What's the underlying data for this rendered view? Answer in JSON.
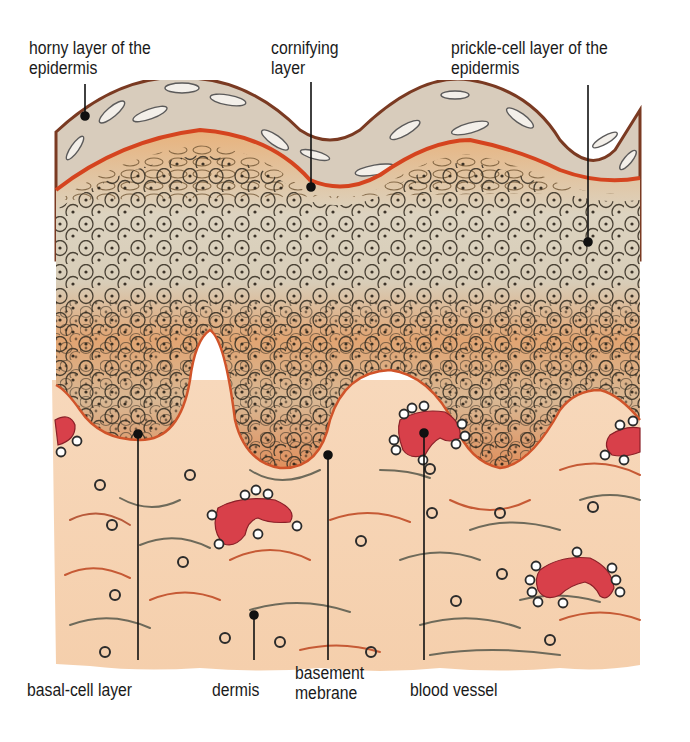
{
  "diagram": {
    "colors": {
      "background": "#ffffff",
      "horny_layer": "#d6cbbd",
      "horny_outline": "#7a3a22",
      "cornifying_line": "#d5441f",
      "prickle_light": "#d9d2c0",
      "prickle_orange": "#e3a676",
      "dermis": "#f6d2b0",
      "blood_vessel": "#d8404a",
      "cell_outline": "#2b2b2b",
      "leader_line": "#111111",
      "label_text": "#1a1a1a"
    },
    "labels": {
      "horny_layer": "horny layer of the\nepidermis",
      "cornifying_layer": "cornifying\nlayer",
      "prickle_cell_layer": "prickle-cell layer of the\nepidermis",
      "basal_cell_layer": "basal-cell layer",
      "dermis": "dermis",
      "basement_membrane": "basement\nmebrane",
      "blood_vessel": "blood vessel"
    }
  }
}
